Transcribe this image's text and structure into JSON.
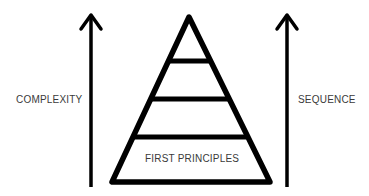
{
  "diagram": {
    "type": "pyramid",
    "left_axis": {
      "label": "COMPLEXITY",
      "direction": "up"
    },
    "right_axis": {
      "label": "SEQUENCE",
      "direction": "up"
    },
    "pyramid": {
      "levels": 4,
      "base_label": "FIRST PRINCIPLES"
    },
    "colors": {
      "stroke": "#000000",
      "text": "#3a3a3a",
      "background": "#ffffff"
    }
  }
}
